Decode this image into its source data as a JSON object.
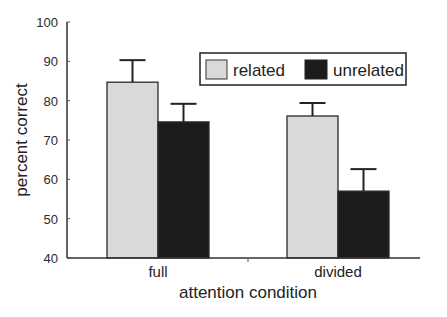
{
  "chart_data": {
    "type": "bar",
    "title": "",
    "xlabel": "attention condition",
    "ylabel": "percent correct",
    "ylim": [
      40,
      100
    ],
    "yticks": [
      40,
      50,
      60,
      70,
      80,
      90,
      100
    ],
    "ytick_labels": [
      "40",
      "50",
      "60",
      "70",
      "80",
      "90",
      "100"
    ],
    "categories": [
      "full",
      "divided"
    ],
    "series": [
      {
        "name": "related",
        "color": "#d9d9d9",
        "values": [
          84.7,
          76.1
        ],
        "errors": [
          5.6,
          3.3
        ]
      },
      {
        "name": "unrelated",
        "color": "#1c1c1c",
        "values": [
          74.6,
          57.0
        ],
        "errors": [
          4.6,
          5.6
        ]
      }
    ],
    "legend": {
      "position": "top-right",
      "boxed": true
    },
    "grid": false,
    "error_bars": "upper"
  }
}
